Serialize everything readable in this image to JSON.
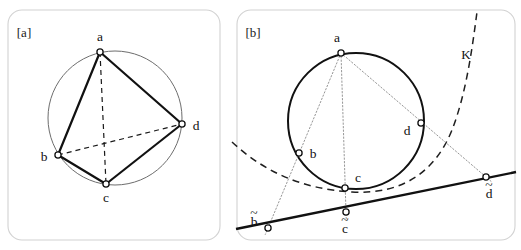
{
  "figure": {
    "width": 521,
    "height": 250,
    "background": "#ffffff",
    "type": "geometry-diagram"
  },
  "panels": [
    {
      "id": "panel-a",
      "label": "[a]",
      "label_pos": {
        "x": 24,
        "y": 37
      },
      "frame": {
        "x": 8,
        "y": 10,
        "width": 212,
        "height": 230,
        "rx": 14
      },
      "circle": {
        "cx": 115,
        "cy": 118,
        "r": 67,
        "style": "thin-solid",
        "color": "#6d6d6d"
      },
      "points": [
        {
          "name": "a",
          "x": 100,
          "y": 52,
          "label": "a",
          "label_x": 100,
          "label_y": 41
        },
        {
          "name": "b",
          "x": 58,
          "y": 155,
          "label": "b",
          "label_x": 44,
          "label_y": 161
        },
        {
          "name": "c",
          "x": 106,
          "y": 184,
          "label": "c",
          "label_x": 106,
          "label_y": 202
        },
        {
          "name": "d",
          "x": 182,
          "y": 124,
          "label": "d",
          "label_x": 196,
          "label_y": 130
        }
      ],
      "solid_edges": [
        {
          "from": "a",
          "to": "b"
        },
        {
          "from": "a",
          "to": "d"
        },
        {
          "from": "b",
          "to": "c"
        },
        {
          "from": "c",
          "to": "d"
        }
      ],
      "dashed_edges": [
        {
          "from": "a",
          "to": "c"
        },
        {
          "from": "b",
          "to": "d"
        }
      ]
    },
    {
      "id": "panel-b",
      "label": "[b]",
      "label_pos": {
        "x": 253,
        "y": 37
      },
      "frame": {
        "x": 237,
        "y": 10,
        "width": 278,
        "height": 230,
        "rx": 14
      },
      "circle": {
        "cx": 356,
        "cy": 121,
        "r": 68,
        "style": "thick-solid",
        "color": "#111111"
      },
      "points": [
        {
          "name": "a",
          "x": 341,
          "y": 53,
          "label": "a",
          "label_x": 337,
          "label_y": 42
        },
        {
          "name": "b",
          "x": 299,
          "y": 153,
          "label": "b",
          "label_x": 313,
          "label_y": 158
        },
        {
          "name": "c",
          "x": 345,
          "y": 188,
          "label": "c",
          "label_x": 358,
          "label_y": 182
        },
        {
          "name": "d",
          "x": 421,
          "y": 123,
          "label": "d",
          "label_x": 407,
          "label_y": 135
        },
        {
          "name": "b-tilde",
          "x": 268,
          "y": 228,
          "label": "b",
          "label_x": 254,
          "label_y": 226,
          "tilde": true
        },
        {
          "name": "c-tilde",
          "x": 346,
          "y": 212,
          "label": "c",
          "label_x": 345,
          "label_y": 233,
          "tilde": true
        },
        {
          "name": "d-tilde",
          "x": 486,
          "y": 177,
          "label": "d",
          "label_x": 489,
          "label_y": 198,
          "tilde": true
        }
      ],
      "projection_rays": [
        {
          "from": "a",
          "to": "b-tilde"
        },
        {
          "from": "a",
          "to": "c-tilde"
        },
        {
          "from": "a",
          "to": "d-tilde"
        }
      ],
      "axis_line": {
        "name": "projection-line",
        "x1": 236,
        "y1": 229,
        "x2": 516,
        "y2": 172,
        "style": "thick-solid"
      },
      "conic": {
        "name": "K",
        "label": "K",
        "label_x": 466,
        "label_y": 59,
        "style": "dashed",
        "path": "M 232 142 C 262 170, 300 189, 352 192 C 404 195, 436 170, 452 130 C 466 94, 472 50, 477 12"
      }
    }
  ],
  "style_tokens": {
    "frame_stroke": "#d2d2d2",
    "ink": "#111111",
    "thin_ink": "#6d6d6d",
    "ray_ink": "#8a8a8a",
    "node_fill": "#ffffff"
  }
}
